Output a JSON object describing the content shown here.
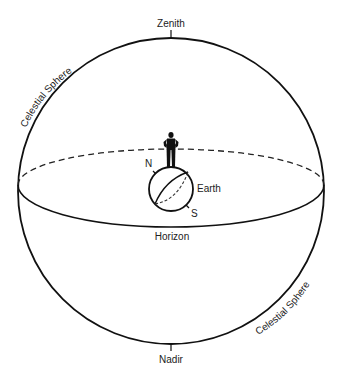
{
  "diagram": {
    "type": "celestial-sphere",
    "labels": {
      "zenith": "Zenith",
      "nadir": "Nadir",
      "horizon": "Horizon",
      "earth": "Earth",
      "north": "N",
      "south": "S",
      "celestial_sphere_upper": "Celestial Sphere",
      "celestial_sphere_lower": "Celestial Sphere"
    },
    "colors": {
      "stroke": "#111111",
      "background": "#ffffff",
      "text": "#222222"
    }
  }
}
